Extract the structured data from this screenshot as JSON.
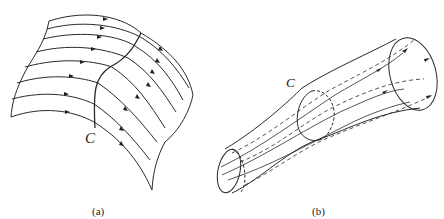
{
  "figure": {
    "panel_a": {
      "caption": "(a)",
      "curve_label": "C",
      "description": "Vector lines passing through a curve C on a surface, forming a vector surface"
    },
    "panel_b": {
      "caption": "(b)",
      "curve_label": "C",
      "description": "Vector lines passing through a closed curve C forming a vector tube"
    },
    "colors": {
      "stroke": "#2a2a2a",
      "background": "#ffffff"
    }
  }
}
